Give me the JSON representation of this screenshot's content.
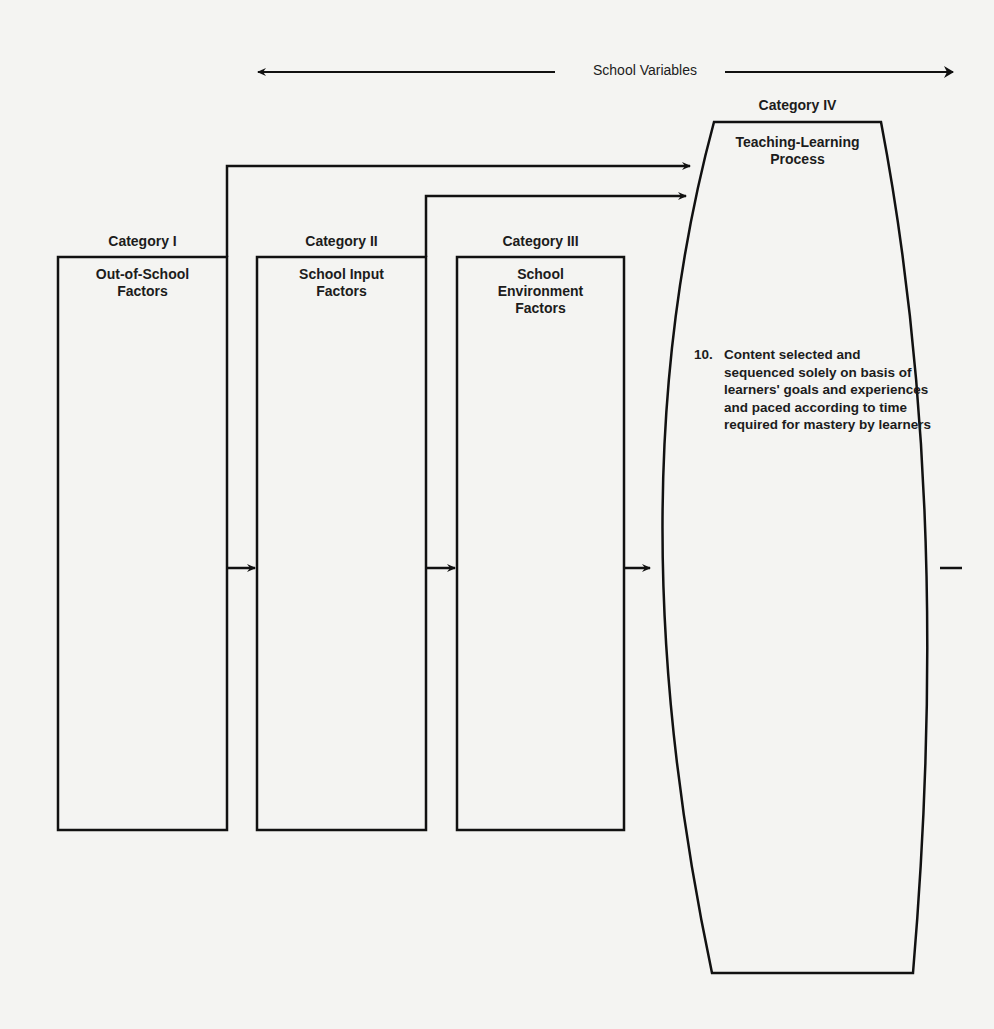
{
  "header": {
    "school_variables": "School Variables"
  },
  "categories": [
    {
      "label": "Category I",
      "title": "Out-of-School Factors",
      "title_lines": [
        "Out-of-School",
        "Factors"
      ]
    },
    {
      "label": "Category II",
      "title": "School Input Factors",
      "title_lines": [
        "School Input",
        "Factors"
      ]
    },
    {
      "label": "Category III",
      "title": "School Environment Factors",
      "title_lines": [
        "School",
        "Environment",
        "Factors"
      ]
    },
    {
      "label": "Category IV",
      "title": "Teaching-Learning Process",
      "title_lines": [
        "Teaching-Learning",
        "Process"
      ]
    }
  ],
  "process_item": {
    "number": "10.",
    "text": "Content selected and sequenced solely on basis of learners' goals and experiences and paced according to time required for mastery by learners"
  },
  "colors": {
    "line": "#111111",
    "background": "#f4f4f2",
    "text": "#1c1c1c"
  }
}
